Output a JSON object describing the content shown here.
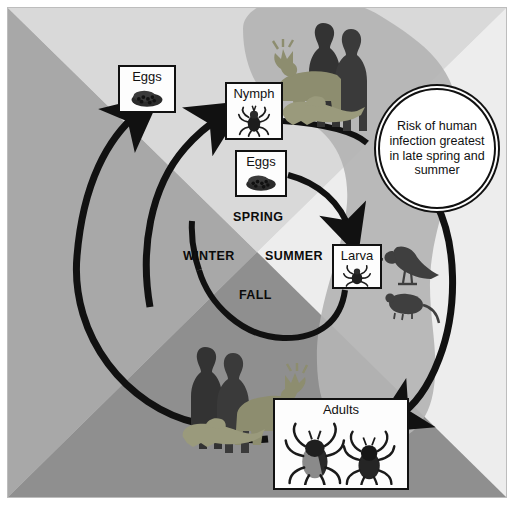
{
  "diagram": {
    "seasons": [
      {
        "name": "SPRING",
        "x": 226,
        "y": 203
      },
      {
        "name": "WINTER",
        "x": 182,
        "y": 242
      },
      {
        "name": "SUMMER",
        "x": 262,
        "y": 242
      },
      {
        "name": "FALL",
        "x": 232,
        "y": 281
      }
    ],
    "stages": [
      {
        "id": "eggs-outer",
        "label": "Eggs",
        "art": "tick-eggs-mass",
        "x": 111,
        "y": 58,
        "w": 58,
        "h": 48
      },
      {
        "id": "nymph",
        "label": "Nymph",
        "art": "nymph-tick",
        "x": 218,
        "y": 75,
        "w": 58,
        "h": 58
      },
      {
        "id": "eggs-inner",
        "label": "Eggs",
        "art": "tick-eggs-mass",
        "x": 228,
        "y": 143,
        "w": 52,
        "h": 47
      },
      {
        "id": "larva",
        "label": "Larva",
        "art": "larva-tick",
        "x": 325,
        "y": 237,
        "w": 50,
        "h": 45
      },
      {
        "id": "adults",
        "label": "Adults",
        "art": "two-adult-ticks",
        "x": 266,
        "y": 391,
        "w": 136,
        "h": 92
      }
    ],
    "callout": {
      "id": "risk-bubble",
      "lines": [
        "Risk of",
        "human",
        "infection",
        "greatest in",
        "late spring",
        "and summer"
      ],
      "text": "Risk of human infection greatest in late spring and summer",
      "x": 371,
      "y": 81,
      "w": 118,
      "h": 121
    },
    "hosts": [
      {
        "id": "host-group-top",
        "art": "humans-deer-fox",
        "x": 262,
        "y": 8,
        "w": 124,
        "h": 116
      },
      {
        "id": "host-group-bottom",
        "art": "humans-deer-fox",
        "x": 166,
        "y": 332,
        "w": 130,
        "h": 120
      },
      {
        "id": "host-bird-mouse",
        "art": "bird-and-mouse",
        "x": 369,
        "y": 232,
        "w": 70,
        "h": 78
      }
    ],
    "arrows": [
      {
        "id": "arrow-nymph-to-humans",
        "from": "nymph",
        "to": "host-group-top"
      },
      {
        "id": "arrow-eggs-to-larva",
        "from": "eggs-inner",
        "to": "larva"
      },
      {
        "id": "arrow-larva-to-fall",
        "from": "larva",
        "to": "fall-segment"
      },
      {
        "id": "arrow-adults-to-eggs-outer",
        "from": "adults",
        "to": "eggs-outer"
      },
      {
        "id": "arrow-winter-to-nymph",
        "from": "winter-segment",
        "to": "nymph"
      },
      {
        "id": "arrow-bubble-to-adults",
        "from": "risk-bubble",
        "to": "adults"
      }
    ],
    "colors": {
      "quad_top": "#d9d9d9",
      "quad_left": "#a8a8a8",
      "quad_right": "#ededed",
      "quad_bottom": "#8f8f8f",
      "blob": "#b4b4b4",
      "ink": "#111111",
      "card_bg": "#fdfdfd",
      "page_bg": "#ffffff"
    }
  }
}
